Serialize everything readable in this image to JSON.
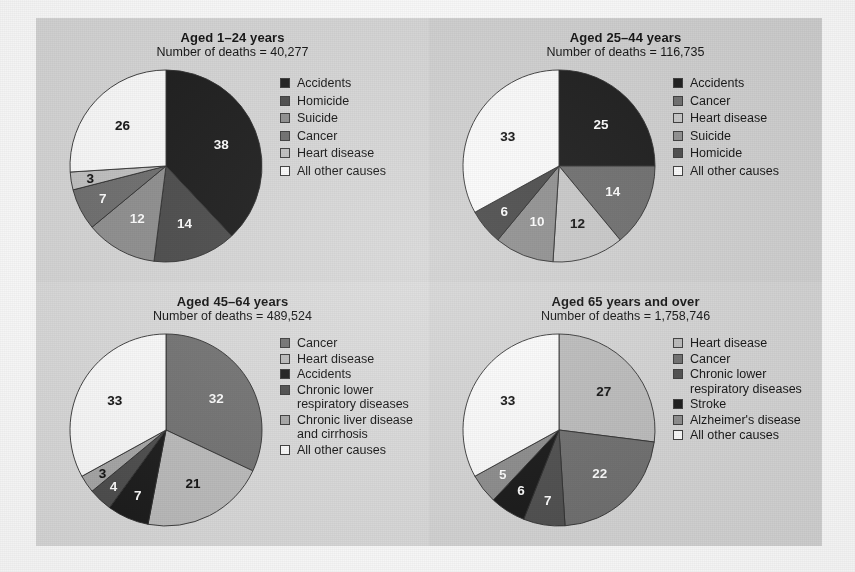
{
  "figure": {
    "background": "#ffffff",
    "plate_background": "#d9d9d9"
  },
  "palette": {
    "black": "#1a1a1a",
    "dark_gray": "#4a4a4a",
    "mid_dark_gray": "#6e6e6e",
    "mid_gray": "#8f8f8f",
    "light_gray": "#b9b9b9",
    "very_light_gray": "#d5d5d5",
    "white": "#fdfdfd"
  },
  "chart_data": [
    {
      "type": "pie",
      "title": "Aged 1–24 years",
      "subtitle": "Number of deaths = 40,277",
      "deaths": "40,277",
      "legend_position": "right",
      "categories": [
        "Accidents",
        "Homicide",
        "Suicide",
        "Cancer",
        "Heart disease",
        "All other causes"
      ],
      "values": [
        38,
        14,
        12,
        7,
        3,
        26
      ],
      "colors": [
        "#1a1a1a",
        "#4a4a4a",
        "#8f8f8f",
        "#6e6e6e",
        "#c2c2c2",
        "#fdfdfd"
      ],
      "label_colors": [
        "#ffffff",
        "#ffffff",
        "#ffffff",
        "#ffffff",
        "#111111",
        "#111111"
      ],
      "start_angle": 0,
      "units": "percent"
    },
    {
      "type": "pie",
      "title": "Aged 25–44 years",
      "subtitle": "Number of deaths = 116,735",
      "deaths": "116,735",
      "legend_position": "right",
      "categories": [
        "Accidents",
        "Cancer",
        "Heart disease",
        "Suicide",
        "Homicide",
        "All other causes"
      ],
      "values": [
        25,
        14,
        12,
        10,
        6,
        33
      ],
      "colors": [
        "#1a1a1a",
        "#6e6e6e",
        "#c9c9c9",
        "#909090",
        "#4a4a4a",
        "#fdfdfd"
      ],
      "label_colors": [
        "#ffffff",
        "#ffffff",
        "#111111",
        "#ffffff",
        "#ffffff",
        "#111111"
      ],
      "start_angle": 0,
      "units": "percent"
    },
    {
      "type": "pie",
      "title": "Aged 45–64 years",
      "subtitle": "Number of deaths = 489,524",
      "deaths": "489,524",
      "legend_position": "right",
      "categories": [
        "Cancer",
        "Heart disease",
        "Accidents",
        "Chronic lower\nrespiratory diseases",
        "Chronic liver disease\nand cirrhosis",
        "All other causes"
      ],
      "values": [
        32,
        21,
        7,
        4,
        3,
        33
      ],
      "colors": [
        "#737373",
        "#bdbdbd",
        "#1a1a1a",
        "#4d4d4d",
        "#a8a8a8",
        "#fdfdfd"
      ],
      "label_colors": [
        "#ffffff",
        "#111111",
        "#ffffff",
        "#ffffff",
        "#111111",
        "#111111"
      ],
      "start_angle": 0,
      "units": "percent"
    },
    {
      "type": "pie",
      "title": "Aged 65 years and over",
      "subtitle": "Number of deaths = 1,758,746",
      "deaths": "1,758,746",
      "legend_position": "right",
      "categories": [
        "Heart disease",
        "Cancer",
        "Chronic lower\nrespiratory diseases",
        "Stroke",
        "Alzheimer's disease",
        "All other causes"
      ],
      "values": [
        27,
        22,
        7,
        6,
        5,
        33
      ],
      "colors": [
        "#bdbdbd",
        "#6e6e6e",
        "#4d4d4d",
        "#151515",
        "#8c8c8c",
        "#fdfdfd"
      ],
      "label_colors": [
        "#111111",
        "#ffffff",
        "#ffffff",
        "#ffffff",
        "#ffffff",
        "#111111"
      ],
      "start_angle": 0,
      "units": "percent"
    }
  ]
}
